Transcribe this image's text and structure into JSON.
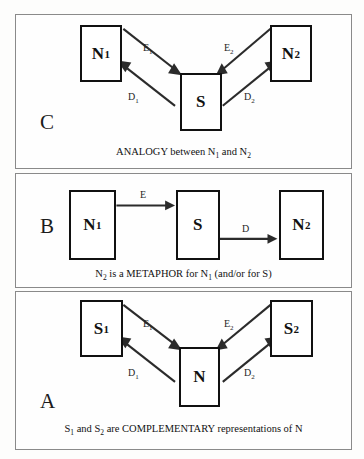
{
  "figure": {
    "background_color": "#fdfdfc",
    "line_color": "#2b2b2b",
    "box_border_color": "#111111",
    "panel_border_color": "#8a8a8a"
  },
  "panels": [
    {
      "id": "C",
      "letter": "C",
      "nodes": [
        {
          "name": "node-n1",
          "label": "N",
          "sub": "1"
        },
        {
          "name": "node-s",
          "label": "S",
          "sub": ""
        },
        {
          "name": "node-n2",
          "label": "N",
          "sub": "2"
        }
      ],
      "edges": [
        {
          "name": "edge-e1",
          "label": "E",
          "sub": "1",
          "from": "N1",
          "to": "S"
        },
        {
          "name": "edge-d1",
          "label": "D",
          "sub": "1",
          "from": "S",
          "to": "N1"
        },
        {
          "name": "edge-e2",
          "label": "E",
          "sub": "2",
          "from": "N2",
          "to": "S"
        },
        {
          "name": "edge-d2",
          "label": "D",
          "sub": "2",
          "from": "S",
          "to": "N2"
        }
      ],
      "caption": {
        "prefix": "ANALOGY between N",
        "sub1": "1",
        "middle": " and N",
        "sub2": "2",
        "suffix": ""
      }
    },
    {
      "id": "B",
      "letter": "B",
      "nodes": [
        {
          "name": "node-n1",
          "label": "N",
          "sub": "1"
        },
        {
          "name": "node-s",
          "label": "S",
          "sub": ""
        },
        {
          "name": "node-n2",
          "label": "N",
          "sub": "2"
        }
      ],
      "edges": [
        {
          "name": "edge-e",
          "label": "E",
          "sub": "",
          "from": "N1",
          "to": "S"
        },
        {
          "name": "edge-d",
          "label": "D",
          "sub": "",
          "from": "S",
          "to": "N2"
        }
      ],
      "caption": {
        "prefix": "N",
        "sub1": "2",
        "middle": " is a METAPHOR for N",
        "sub2": "1",
        "suffix": " (and/or for S)"
      }
    },
    {
      "id": "A",
      "letter": "A",
      "nodes": [
        {
          "name": "node-s1",
          "label": "S",
          "sub": "1"
        },
        {
          "name": "node-n",
          "label": "N",
          "sub": ""
        },
        {
          "name": "node-s2",
          "label": "S",
          "sub": "2"
        }
      ],
      "edges": [
        {
          "name": "edge-e1",
          "label": "E",
          "sub": "1",
          "from": "S1",
          "to": "N"
        },
        {
          "name": "edge-d1",
          "label": "D",
          "sub": "1",
          "from": "N",
          "to": "S1"
        },
        {
          "name": "edge-e2",
          "label": "E",
          "sub": "2",
          "from": "S2",
          "to": "N"
        },
        {
          "name": "edge-d2",
          "label": "D",
          "sub": "2",
          "from": "N",
          "to": "S2"
        }
      ],
      "caption": {
        "prefix": "S",
        "sub1": "1",
        "middle": " and S",
        "sub2": "2",
        "suffix": " are COMPLEMENTARY representations of N"
      }
    }
  ]
}
